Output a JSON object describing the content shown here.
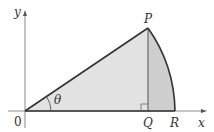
{
  "figure": {
    "colors": {
      "axis": "#8a8a8a",
      "outline": "#333333",
      "triangle_fill": "#e2e2e2",
      "segment_fill": "#cfcfcf"
    },
    "labels": {
      "y_axis": "y",
      "x_axis": "x",
      "origin": "0",
      "P": "P",
      "Q": "Q",
      "R": "R",
      "angle": "θ"
    }
  }
}
